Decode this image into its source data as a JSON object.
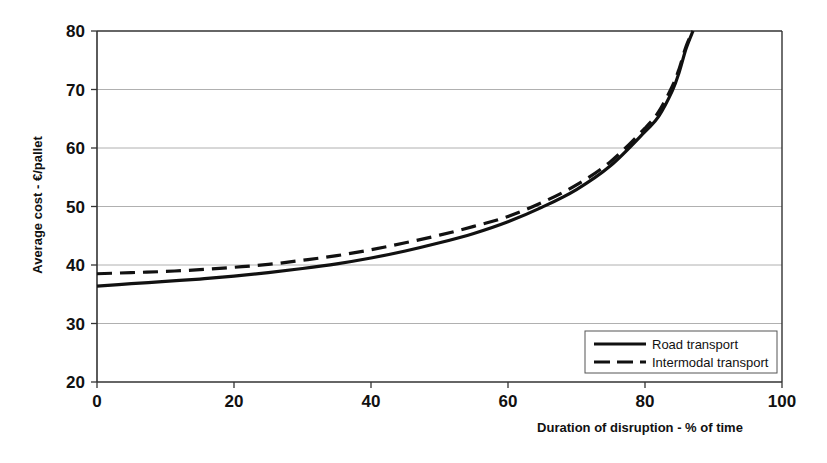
{
  "chart_data": {
    "type": "line",
    "title": "",
    "xlabel": "Duration of disruption - % of time",
    "ylabel": "Average cost - €/pallet",
    "xlim": [
      0,
      100
    ],
    "ylim": [
      20,
      80
    ],
    "xticks": [
      0,
      20,
      40,
      60,
      80,
      100
    ],
    "yticks": [
      20,
      30,
      40,
      50,
      60,
      70,
      80
    ],
    "xtick_labels": [
      "0",
      "20",
      "40",
      "60",
      "80",
      "100"
    ],
    "ytick_labels": [
      "20",
      "30",
      "40",
      "50",
      "60",
      "70",
      "80"
    ],
    "grid": "horizontal",
    "legend_position": "bottom-right",
    "x": [
      0,
      5,
      10,
      15,
      20,
      25,
      30,
      35,
      40,
      45,
      50,
      55,
      60,
      65,
      70,
      75,
      80,
      82,
      84,
      85,
      86,
      87
    ],
    "series": [
      {
        "name": "Road transport",
        "style": "solid",
        "color": "#111111",
        "values": [
          36.4,
          36.8,
          37.2,
          37.6,
          38.1,
          38.7,
          39.4,
          40.2,
          41.2,
          42.4,
          43.8,
          45.4,
          47.4,
          49.9,
          52.9,
          57.0,
          62.8,
          65.4,
          69.8,
          73.0,
          77.0,
          80.0
        ]
      },
      {
        "name": "Intermodal transport",
        "style": "dashed",
        "color": "#111111",
        "values": [
          38.5,
          38.7,
          38.9,
          39.2,
          39.6,
          40.1,
          40.8,
          41.6,
          42.6,
          43.8,
          45.1,
          46.6,
          48.3,
          50.7,
          53.7,
          57.7,
          63.4,
          66.2,
          70.6,
          73.6,
          77.4,
          80.0
        ]
      }
    ]
  },
  "legend": {
    "items": [
      {
        "label": "Road transport",
        "style": "solid"
      },
      {
        "label": "Intermodal transport",
        "style": "dashed"
      }
    ]
  },
  "colors": {
    "line": "#111111",
    "grid": "#b0b0b0",
    "axis": "#333333",
    "background": "#ffffff",
    "legend_border": "#555555"
  }
}
